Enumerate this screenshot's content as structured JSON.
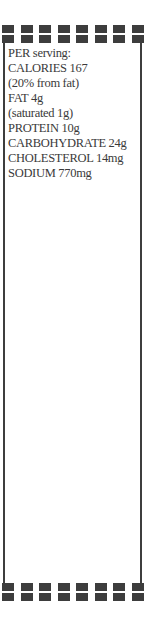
{
  "card": {
    "heading": "PER serving:",
    "lines": [
      "CALORIES 167",
      "(20% from fat)",
      "FAT 4g",
      "(saturated 1g)",
      "PROTEIN 10g",
      "CARBOHYDRATE 24g",
      "CHOLESTEROL 14mg",
      "SODIUM 770mg"
    ],
    "border_color": "#3d3d3d",
    "text_color": "#3a3a3a",
    "decoration": {
      "squares_per_row": 8,
      "top_rows": 2,
      "bottom_rows": 2
    }
  }
}
